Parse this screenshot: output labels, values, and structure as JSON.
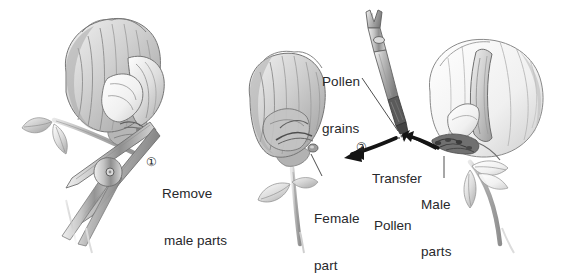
{
  "figure": {
    "background_color": "#ffffff",
    "text_color": "#27282b",
    "ink_color": "#5a5a5a",
    "arrow_color": "#1a1a1a"
  },
  "steps": [
    {
      "number": "①",
      "number_value": 1,
      "line1": "Remove",
      "line2": "male parts"
    },
    {
      "number": "②",
      "number_value": 2,
      "line1": "Transfer",
      "line2": "Pollen"
    }
  ],
  "labels": {
    "pollen_grains": {
      "line1": "Pollen",
      "line2": "grains"
    },
    "female_part": {
      "line1": "Female",
      "line2": "part"
    },
    "male_parts": {
      "line1": "Male",
      "line2": "parts"
    }
  },
  "illustration": {
    "left_flower": "pea-flower-with-scissors",
    "middle_flower": "pea-flower-emasculated-female",
    "right_flower": "pea-flower-male-parts-exposed",
    "tool_top": "forceps-with-pollen",
    "tool_left": "scissors",
    "arrows": [
      "arrow-from-male-flower-to-forceps",
      "arrow-from-forceps-to-female-flower"
    ]
  }
}
